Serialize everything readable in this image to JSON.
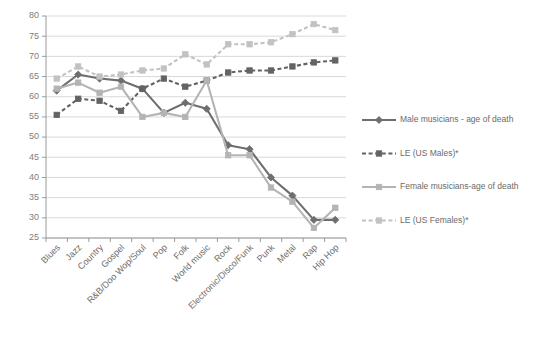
{
  "chart_data": {
    "type": "line",
    "title": "",
    "xlabel": "",
    "ylabel": "",
    "ylim": [
      25,
      80
    ],
    "ytick_step": 5,
    "yticks": [
      25,
      30,
      35,
      40,
      45,
      50,
      55,
      60,
      65,
      70,
      75,
      80
    ],
    "grid": true,
    "legend_position": "right",
    "categories": [
      "Blues",
      "Jazz",
      "Country",
      "Gospel",
      "R&B/Doo Wop/Soul",
      "Pop",
      "Folk",
      "World music",
      "Rock",
      "Electronic/Disco/Funk",
      "Punk",
      "Metal",
      "Rap",
      "Hip Hop"
    ],
    "series": [
      {
        "name": "Male musicians - age of death",
        "color": "#6e6e6e",
        "dash": "solid",
        "marker": "diamond",
        "values": [
          61.5,
          65.5,
          64.5,
          64.0,
          62.0,
          56.0,
          58.5,
          57.0,
          48.0,
          47.0,
          40.0,
          35.5,
          29.5,
          29.5
        ]
      },
      {
        "name": "LE (US Males)*",
        "color": "#636363",
        "dash": "dashed",
        "marker": "square",
        "values": [
          55.5,
          59.5,
          59.0,
          56.5,
          62.0,
          64.5,
          62.5,
          64.0,
          66.0,
          66.5,
          66.5,
          67.5,
          68.5,
          69.0
        ]
      },
      {
        "name": "Female musicians-age of death",
        "color": "#b4b4b4",
        "dash": "solid",
        "marker": "square",
        "values": [
          62.0,
          63.5,
          61.0,
          62.5,
          55.0,
          56.0,
          55.0,
          64.0,
          45.5,
          45.5,
          37.5,
          34.0,
          27.5,
          32.5
        ]
      },
      {
        "name": "LE (US Females)*",
        "color": "#c2c2c2",
        "dash": "dashed",
        "marker": "square",
        "values": [
          64.5,
          67.5,
          65.0,
          65.5,
          66.5,
          67.0,
          70.5,
          68.0,
          73.0,
          73.0,
          73.5,
          75.5,
          78.0,
          76.5
        ]
      }
    ]
  },
  "legend": {
    "entries": [
      {
        "label": "Male musicians - age of death"
      },
      {
        "label": "LE (US Males)*"
      },
      {
        "label": "Female musicians-age of death"
      },
      {
        "label": "LE (US Females)*"
      }
    ]
  }
}
